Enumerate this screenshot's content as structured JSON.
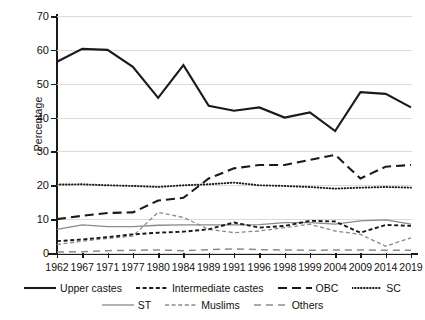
{
  "chart_data": {
    "type": "line",
    "title": "",
    "xlabel": "",
    "ylabel": "Percentage",
    "ylim": [
      0,
      70
    ],
    "ytick_labels": [
      "0",
      "10",
      "20",
      "30",
      "40",
      "50",
      "60",
      "70"
    ],
    "grid": true,
    "legend_position": "bottom",
    "categories": [
      "1962",
      "1967",
      "1971",
      "1977",
      "1980",
      "1984",
      "1989",
      "1991",
      "1996",
      "1998",
      "1999",
      "2004",
      "2009",
      "2014",
      "2019"
    ],
    "series": [
      {
        "name": "Upper castes",
        "style": "solid-thick",
        "color": "#1a1a1a",
        "values": [
          56.5,
          60.3,
          60.0,
          55.0,
          45.8,
          55.5,
          43.5,
          42.0,
          43.0,
          40.0,
          41.5,
          36.0,
          47.5,
          47.0,
          43.0
        ]
      },
      {
        "name": "Intermediate castes",
        "style": "dashed-fine",
        "color": "#1a1a1a",
        "values": [
          3.5,
          4.0,
          4.7,
          5.5,
          6.0,
          6.3,
          7.0,
          9.0,
          7.5,
          8.0,
          9.5,
          9.3,
          6.0,
          8.3,
          8.0
        ]
      },
      {
        "name": "OBC",
        "style": "dashed-long",
        "color": "#1a1a1a",
        "values": [
          10.0,
          11.0,
          11.8,
          12.0,
          15.5,
          16.3,
          22.0,
          25.0,
          26.0,
          26.0,
          27.5,
          29.0,
          22.0,
          25.5,
          26.0
        ]
      },
      {
        "name": "SC",
        "style": "dotted",
        "color": "#1a1a1a",
        "values": [
          20.2,
          20.3,
          20.0,
          19.8,
          19.5,
          20.0,
          20.3,
          20.8,
          20.0,
          19.8,
          19.5,
          19.0,
          19.3,
          19.5,
          19.3
        ]
      },
      {
        "name": "ST",
        "style": "solid-thin",
        "color": "#8a8a8a",
        "values": [
          7.0,
          8.3,
          7.8,
          7.8,
          8.2,
          8.3,
          8.3,
          8.3,
          8.4,
          9.0,
          9.0,
          8.5,
          9.5,
          9.8,
          8.5
        ]
      },
      {
        "name": "Muslims",
        "style": "dashed-grey",
        "color": "#8a8a8a",
        "values": [
          2.5,
          3.5,
          4.3,
          5.0,
          12.0,
          10.5,
          7.0,
          6.0,
          6.5,
          7.5,
          8.5,
          6.5,
          5.5,
          2.0,
          4.5
        ]
      },
      {
        "name": "Others",
        "style": "dashed-grey-long",
        "color": "#8a8a8a",
        "values": [
          0.3,
          0.4,
          0.7,
          0.8,
          0.9,
          0.7,
          1.0,
          1.2,
          1.0,
          0.9,
          0.8,
          0.9,
          0.9,
          0.8,
          0.8
        ]
      }
    ]
  },
  "legend": {
    "row1": [
      {
        "label": "Upper castes"
      },
      {
        "label": "Intermediate castes"
      },
      {
        "label": "OBC"
      },
      {
        "label": "SC"
      }
    ],
    "row2": [
      {
        "label": "ST"
      },
      {
        "label": "Muslims"
      },
      {
        "label": "Others"
      }
    ]
  },
  "axis": {
    "y_label": "Percentage"
  }
}
